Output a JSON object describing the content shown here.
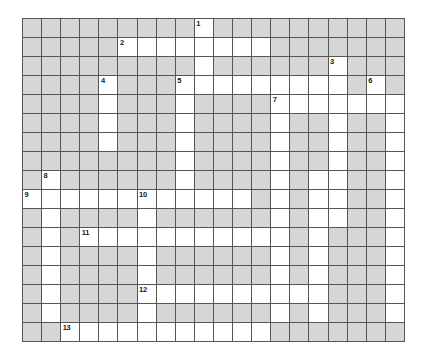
{
  "puzzle": {
    "title": "Crossword Grid",
    "type": "crossword",
    "columns": 20,
    "rows": 17,
    "cell_size_px": 19,
    "colors": {
      "blocked_cell": "#d6d6d6",
      "open_cell": "#ffffff",
      "grid_line": "#555555",
      "number_text": "#1a1a1a",
      "page_background": "#ffffff"
    },
    "legend": {
      "blocked": "gray filled square (not writable)",
      "open": "white square (writable letter cell)"
    },
    "clue_numbers": [
      {
        "number": "1",
        "row": 0,
        "col": 9
      },
      {
        "number": "2",
        "row": 1,
        "col": 5
      },
      {
        "number": "3",
        "row": 2,
        "col": 16
      },
      {
        "number": "4",
        "row": 3,
        "col": 4
      },
      {
        "number": "5",
        "row": 3,
        "col": 8
      },
      {
        "number": "6",
        "row": 3,
        "col": 18
      },
      {
        "number": "7",
        "row": 4,
        "col": 13
      },
      {
        "number": "8",
        "row": 8,
        "col": 1
      },
      {
        "number": "9",
        "row": 9,
        "col": 0
      },
      {
        "number": "10",
        "row": 9,
        "col": 6
      },
      {
        "number": "11",
        "row": 11,
        "col": 3
      },
      {
        "number": "12",
        "row": 14,
        "col": 6
      },
      {
        "number": "13",
        "row": 16,
        "col": 2
      }
    ],
    "grid": [
      [
        0,
        0,
        0,
        0,
        0,
        0,
        0,
        0,
        0,
        1,
        0,
        0,
        0,
        0,
        0,
        0,
        0,
        0,
        0,
        0
      ],
      [
        0,
        0,
        0,
        0,
        0,
        1,
        1,
        1,
        1,
        1,
        1,
        1,
        1,
        0,
        0,
        0,
        0,
        0,
        0,
        0
      ],
      [
        0,
        0,
        0,
        0,
        0,
        0,
        0,
        0,
        0,
        1,
        0,
        0,
        0,
        0,
        0,
        0,
        1,
        0,
        0,
        0
      ],
      [
        0,
        0,
        0,
        0,
        1,
        0,
        0,
        0,
        1,
        1,
        1,
        1,
        1,
        1,
        1,
        1,
        1,
        0,
        1,
        0
      ],
      [
        0,
        0,
        0,
        0,
        1,
        0,
        0,
        0,
        1,
        0,
        0,
        0,
        0,
        1,
        1,
        1,
        1,
        1,
        1,
        1
      ],
      [
        0,
        0,
        0,
        0,
        1,
        0,
        0,
        0,
        1,
        0,
        0,
        0,
        0,
        1,
        0,
        0,
        1,
        0,
        0,
        1
      ],
      [
        0,
        0,
        0,
        0,
        1,
        0,
        0,
        0,
        1,
        0,
        0,
        0,
        0,
        1,
        0,
        0,
        1,
        0,
        0,
        1
      ],
      [
        0,
        0,
        0,
        0,
        0,
        0,
        0,
        0,
        1,
        0,
        0,
        0,
        0,
        1,
        0,
        0,
        1,
        0,
        0,
        1
      ],
      [
        0,
        1,
        0,
        0,
        0,
        0,
        0,
        0,
        1,
        0,
        0,
        0,
        0,
        1,
        0,
        1,
        1,
        0,
        0,
        1
      ],
      [
        1,
        1,
        1,
        1,
        1,
        1,
        1,
        1,
        1,
        1,
        1,
        1,
        0,
        1,
        0,
        1,
        1,
        0,
        0,
        1
      ],
      [
        0,
        1,
        0,
        0,
        0,
        0,
        1,
        0,
        0,
        0,
        0,
        0,
        0,
        1,
        0,
        1,
        1,
        0,
        0,
        1
      ],
      [
        0,
        1,
        0,
        1,
        1,
        1,
        1,
        1,
        1,
        1,
        1,
        1,
        1,
        1,
        0,
        1,
        0,
        0,
        0,
        1
      ],
      [
        0,
        1,
        0,
        0,
        0,
        0,
        1,
        0,
        0,
        0,
        0,
        0,
        0,
        1,
        0,
        1,
        0,
        0,
        0,
        1
      ],
      [
        0,
        1,
        0,
        0,
        0,
        0,
        1,
        0,
        0,
        0,
        0,
        0,
        0,
        1,
        0,
        1,
        0,
        0,
        0,
        1
      ],
      [
        0,
        1,
        0,
        0,
        0,
        0,
        1,
        1,
        1,
        1,
        1,
        1,
        1,
        1,
        1,
        1,
        0,
        0,
        0,
        1
      ],
      [
        0,
        1,
        0,
        0,
        0,
        0,
        1,
        0,
        0,
        0,
        0,
        0,
        0,
        1,
        0,
        1,
        0,
        0,
        0,
        1
      ],
      [
        0,
        0,
        1,
        1,
        1,
        1,
        1,
        1,
        1,
        1,
        1,
        1,
        1,
        0,
        0,
        0,
        0,
        0,
        0,
        0
      ]
    ]
  }
}
